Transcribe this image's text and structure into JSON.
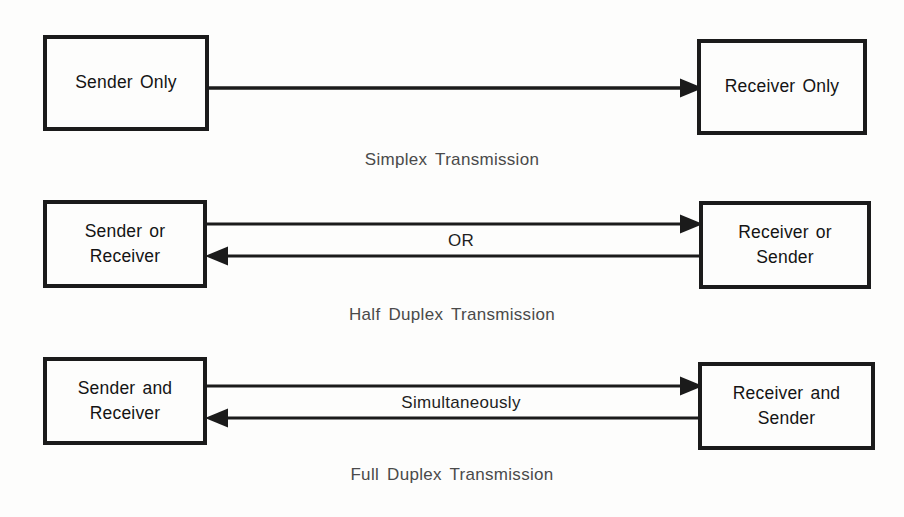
{
  "figure": {
    "background_color": "#fdfdfc",
    "ink_color": "#1b1b1b",
    "caption_color": "#4a4a4a"
  },
  "rows": [
    {
      "id": "simplex",
      "left_box": {
        "lines": [
          "Sender Only"
        ]
      },
      "right_box": {
        "lines": [
          "Receiver Only"
        ]
      },
      "edge_label": "",
      "caption": "Simplex Transmission",
      "arrows": [
        "left-to-right"
      ]
    },
    {
      "id": "half-duplex",
      "left_box": {
        "lines": [
          "Sender or",
          "Receiver"
        ]
      },
      "right_box": {
        "lines": [
          "Receiver or",
          "Sender"
        ]
      },
      "edge_label": "OR",
      "caption": "Half Duplex Transmission",
      "arrows": [
        "left-to-right",
        "right-to-left"
      ]
    },
    {
      "id": "full-duplex",
      "left_box": {
        "lines": [
          "Sender and",
          "Receiver"
        ]
      },
      "right_box": {
        "lines": [
          "Receiver and",
          "Sender"
        ]
      },
      "edge_label": "Simultaneously",
      "caption": "Full Duplex Transmission",
      "arrows": [
        "left-to-right",
        "right-to-left"
      ]
    }
  ]
}
